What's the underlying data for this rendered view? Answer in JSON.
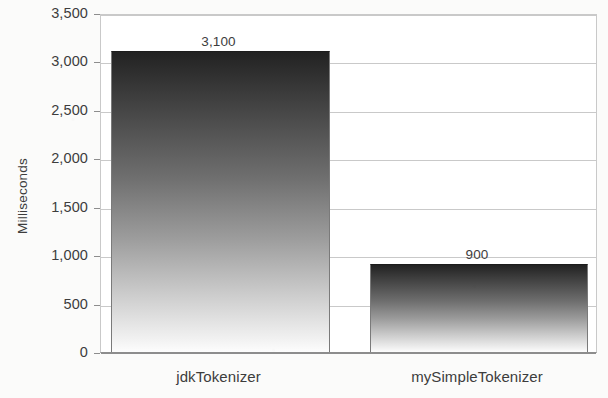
{
  "chart_data": {
    "type": "bar",
    "title": "",
    "subtitle": "",
    "xlabel": "",
    "ylabel": "Milliseconds",
    "categories": [
      "jdkTokenizer",
      "mySimpleTokenizer"
    ],
    "values": [
      3100,
      900
    ],
    "value_labels": [
      "3,100",
      "900"
    ],
    "ylim": [
      0,
      3500
    ],
    "y_ticks": [
      0,
      500,
      1000,
      1500,
      2000,
      2500,
      3000,
      3500
    ],
    "y_tick_labels": [
      "0",
      "500",
      "1,000",
      "1,500",
      "2,000",
      "2,500",
      "3,000",
      "3,500"
    ],
    "grid": true,
    "legend": false,
    "legend_position": "none",
    "series": [
      {
        "name": "Milliseconds",
        "values": [
          3100,
          900
        ],
        "fill": "vertical-gradient-dark-to-light"
      }
    ],
    "colors": {
      "bar_gradient_top": "#222222",
      "bar_gradient_bottom": "#fdfdfd",
      "gridline": "#c9c9c9",
      "axis": "#8d8d8d",
      "text": "#3d3d3d",
      "plot_background": "#ffffff",
      "page_background": "#fbfbfa"
    }
  }
}
